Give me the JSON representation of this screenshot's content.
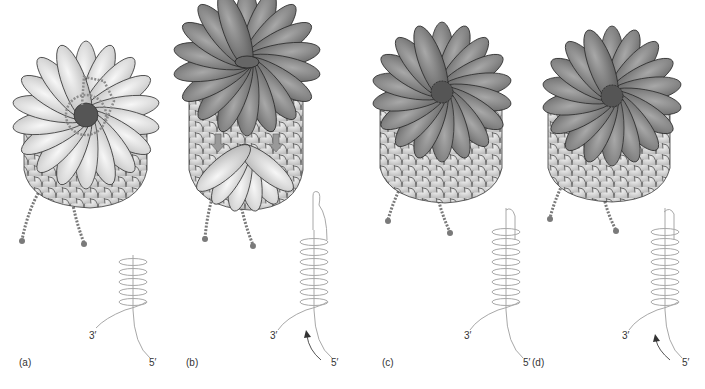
{
  "figure": {
    "colors": {
      "light_subunit": "#e6e6e6",
      "light_subunit_shade": "#b8b8b8",
      "dark_subunit": "#8a8a8a",
      "dark_subunit_shade": "#5e5e5e",
      "outline": "#3a3a3a",
      "tail": "#7a7a7a",
      "rna_line": "#a8a8a8",
      "label_text": "#333333"
    },
    "panels": [
      {
        "id": "a",
        "label": "(a)",
        "top_ring": "light",
        "has_dotted_overlay": true,
        "has_down_arrows": false,
        "rna_hairpin": false,
        "has_curved_arrow": false,
        "three_prime": "3′",
        "five_prime": "5′"
      },
      {
        "id": "b",
        "label": "(b)",
        "top_ring": "dark",
        "has_dotted_overlay": false,
        "has_down_arrows": true,
        "rna_hairpin": true,
        "has_curved_arrow": true,
        "three_prime": "3′",
        "five_prime": "5′"
      },
      {
        "id": "c",
        "label": "(c)",
        "top_ring": "dark",
        "has_dotted_overlay": false,
        "has_down_arrows": false,
        "rna_hairpin": false,
        "has_curved_arrow": false,
        "three_prime": "3′",
        "five_prime": "5′"
      },
      {
        "id": "d",
        "label": "(d)",
        "top_ring": "dark",
        "has_dotted_overlay": false,
        "has_down_arrows": false,
        "rna_hairpin": false,
        "has_curved_arrow": true,
        "three_prime": "3′",
        "five_prime": "5′"
      }
    ]
  }
}
